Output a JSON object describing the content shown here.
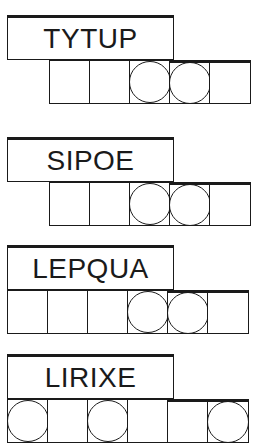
{
  "puzzles": [
    {
      "scrambled": "TYTUP",
      "cell_count": 5,
      "circled_cells": [
        3,
        4
      ]
    },
    {
      "scrambled": "SIPOE",
      "cell_count": 5,
      "circled_cells": [
        3,
        4
      ]
    },
    {
      "scrambled": "LEPQUA",
      "cell_count": 6,
      "circled_cells": [
        4,
        5
      ]
    },
    {
      "scrambled": "LIRIXE",
      "cell_count": 6,
      "circled_cells": [
        1,
        3,
        6
      ]
    }
  ],
  "colors": {
    "ink": "#1a1a1a",
    "background": "#ffffff"
  }
}
